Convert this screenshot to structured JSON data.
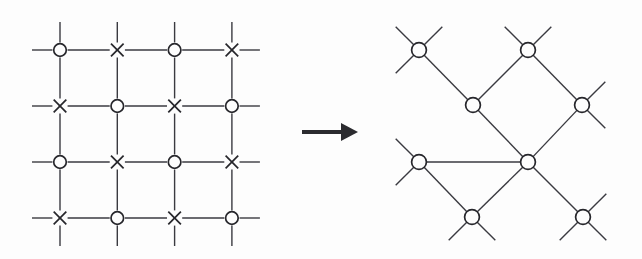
{
  "figure": {
    "background_color": "#fdfdfd",
    "line_color": "#3a3a40",
    "marker_color": "#26262b",
    "arrow_color": "#2b2b2f"
  },
  "left_lattice": {
    "name": "square-lattice",
    "type": "square",
    "rows": 4,
    "cols": 4,
    "origin_x": 60,
    "origin_y": 50,
    "spacing": 57.3,
    "row_spacing": 56,
    "stub_length": 28,
    "circle_radius": 6.3,
    "x_marker_half": 6.3,
    "marker_gap": 7.6,
    "pattern": "checkerboard",
    "markers": [
      [
        "circle",
        "cross",
        "circle",
        "cross"
      ],
      [
        "cross",
        "circle",
        "cross",
        "circle"
      ],
      [
        "circle",
        "cross",
        "circle",
        "cross"
      ],
      [
        "cross",
        "circle",
        "cross",
        "circle"
      ]
    ]
  },
  "arrow": {
    "name": "transform-arrow",
    "glyph": "right-arrow",
    "x1": 302,
    "y": 132,
    "x2": 341,
    "tip_x": 358,
    "head_half_height": 9
  },
  "right_lattice": {
    "name": "diagonal-lattice",
    "type": "rotated-square",
    "circle_radius": 7.4,
    "stub_length": 33,
    "nodes": [
      {
        "id": "a",
        "x": 419,
        "y": 50
      },
      {
        "id": "b",
        "x": 528,
        "y": 50
      },
      {
        "id": "c",
        "x": 473,
        "y": 105
      },
      {
        "id": "d",
        "x": 582,
        "y": 105
      },
      {
        "id": "e",
        "x": 419,
        "y": 162
      },
      {
        "id": "f",
        "x": 528,
        "y": 162
      },
      {
        "id": "g",
        "x": 472,
        "y": 217
      },
      {
        "id": "h",
        "x": 583,
        "y": 217
      }
    ],
    "edges": [
      [
        "a",
        "c"
      ],
      [
        "b",
        "c"
      ],
      [
        "b",
        "d"
      ],
      [
        "c",
        "f"
      ],
      [
        "e",
        "f"
      ],
      [
        "d",
        "f"
      ],
      [
        "f",
        "g"
      ],
      [
        "f",
        "h"
      ],
      [
        "e",
        "g"
      ]
    ],
    "stubs": [
      {
        "from": "a",
        "dx": -1,
        "dy": -1
      },
      {
        "from": "a",
        "dx": -1,
        "dy": 1
      },
      {
        "from": "a",
        "dx": 1,
        "dy": -1
      },
      {
        "from": "b",
        "dx": -1,
        "dy": -1
      },
      {
        "from": "b",
        "dx": 1,
        "dy": -1
      },
      {
        "from": "d",
        "dx": 1,
        "dy": -1
      },
      {
        "from": "d",
        "dx": 1,
        "dy": 1
      },
      {
        "from": "e",
        "dx": -1,
        "dy": -1
      },
      {
        "from": "e",
        "dx": -1,
        "dy": 1
      },
      {
        "from": "g",
        "dx": -1,
        "dy": 1
      },
      {
        "from": "g",
        "dx": 1,
        "dy": 1
      },
      {
        "from": "h",
        "dx": -1,
        "dy": 1
      },
      {
        "from": "h",
        "dx": 1,
        "dy": 1
      },
      {
        "from": "h",
        "dx": 1,
        "dy": -1
      }
    ]
  }
}
